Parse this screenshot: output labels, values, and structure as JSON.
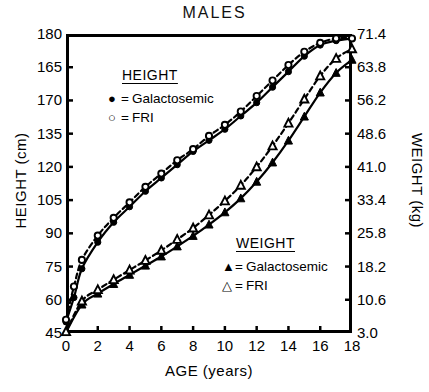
{
  "chart_data": {
    "type": "line",
    "title": "MALES",
    "xlabel": "AGE (years)",
    "ylabel": "HEIGHT (cm)",
    "ylabel_right": "WEIGHT (kg)",
    "xlim": [
      0,
      18
    ],
    "ylim": [
      45,
      180
    ],
    "ylim_right": [
      3.0,
      71.4
    ],
    "xticks": [
      "0",
      "2",
      "4",
      "6",
      "8",
      "10",
      "12",
      "14",
      "16",
      "18"
    ],
    "xtick_values": [
      0,
      2,
      4,
      6,
      8,
      10,
      12,
      14,
      16,
      18
    ],
    "yticks": [
      "180",
      "165",
      "170",
      "135",
      "120",
      "105",
      "90",
      "75",
      "60",
      "45"
    ],
    "ytick_values": [
      180,
      165,
      150,
      135,
      120,
      105,
      90,
      75,
      60,
      45
    ],
    "yticks_right": [
      "71.4",
      "63.8",
      "56.2",
      "48.6",
      "41.0",
      "33.4",
      "25.8",
      "18.2",
      "10.6",
      "3.0"
    ],
    "ytick_right_values": [
      71.4,
      63.8,
      56.2,
      48.6,
      41.0,
      33.4,
      25.8,
      18.2,
      10.6,
      3.0
    ],
    "grid": false,
    "legend_position": "inside",
    "series": [
      {
        "name": "Galactosemic",
        "group": "HEIGHT",
        "axis": "left",
        "marker": "filled-circle",
        "line": "solid",
        "x": [
          0,
          0.5,
          1,
          2,
          3,
          4,
          5,
          6,
          7,
          8,
          9,
          10,
          11,
          12,
          13,
          14,
          15,
          16,
          17,
          18
        ],
        "y": [
          50,
          61,
          74,
          86,
          95,
          102,
          109,
          115,
          121,
          127,
          132,
          137,
          143,
          149,
          156,
          163,
          170,
          175,
          177,
          178
        ]
      },
      {
        "name": "FRI",
        "group": "HEIGHT",
        "axis": "left",
        "marker": "open-circle",
        "line": "dashed",
        "x": [
          0,
          0.5,
          1,
          2,
          3,
          4,
          5,
          6,
          7,
          8,
          9,
          10,
          11,
          12,
          13,
          14,
          15,
          16,
          17,
          18
        ],
        "y": [
          51,
          66,
          78,
          89,
          97,
          104,
          111,
          117,
          123,
          128,
          134,
          139,
          145,
          152,
          159,
          166,
          172,
          176,
          178,
          178
        ]
      },
      {
        "name": "Galactosemic",
        "group": "WEIGHT",
        "axis": "right",
        "marker": "filled-triangle",
        "line": "solid",
        "x": [
          0,
          1,
          2,
          3,
          4,
          5,
          6,
          7,
          8,
          9,
          10,
          11,
          12,
          13,
          14,
          15,
          16,
          17,
          18
        ],
        "y": [
          3.2,
          9.5,
          12.0,
          14.2,
          16.3,
          18.4,
          20.5,
          22.8,
          25.2,
          27.8,
          30.6,
          33.8,
          37.6,
          42.0,
          47.0,
          52.5,
          58.0,
          62.5,
          65.5
        ]
      },
      {
        "name": "FRI",
        "group": "WEIGHT",
        "axis": "right",
        "marker": "open-triangle",
        "line": "dashed",
        "x": [
          0,
          1,
          2,
          3,
          4,
          5,
          6,
          7,
          8,
          9,
          10,
          11,
          12,
          13,
          14,
          15,
          16,
          17,
          18
        ],
        "y": [
          3.3,
          10.3,
          12.9,
          15.2,
          17.4,
          19.6,
          21.9,
          24.4,
          27.0,
          30.0,
          33.2,
          36.8,
          41.0,
          45.8,
          51.0,
          56.5,
          61.8,
          65.8,
          68.0
        ]
      }
    ]
  },
  "legends": {
    "height": {
      "title": "HEIGHT",
      "rows": [
        {
          "marker": "●",
          "eq": "=",
          "label": "Galactosemic"
        },
        {
          "marker": "○",
          "eq": "=",
          "label": "FRI"
        }
      ]
    },
    "weight": {
      "title": "WEIGHT",
      "rows": [
        {
          "marker": "▲",
          "eq": "=",
          "label": "Galactosemic"
        },
        {
          "marker": "△",
          "eq": "=",
          "label": "FRI"
        }
      ]
    }
  },
  "colors": {
    "ink": "#000000",
    "background": "#ffffff"
  }
}
